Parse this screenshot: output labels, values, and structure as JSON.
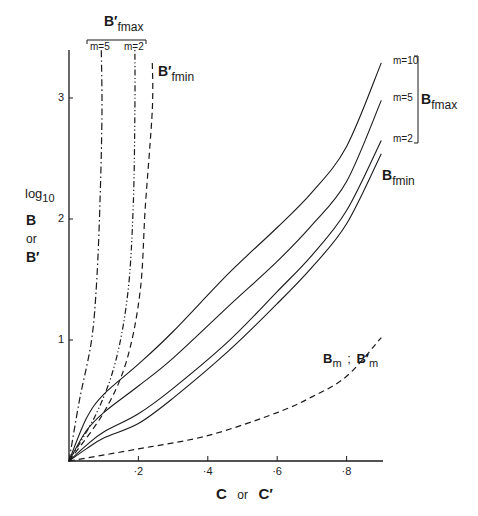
{
  "chart_data": {
    "type": "line",
    "title": "",
    "xlabel": "C or C′",
    "ylabel": "log10 B or B′",
    "xlim": [
      0,
      0.9
    ],
    "ylim": [
      0,
      3.4
    ],
    "grid": false,
    "x_ticks": [
      {
        "value": 0.2,
        "label": "·2"
      },
      {
        "value": 0.4,
        "label": "·4"
      },
      {
        "value": 0.6,
        "label": "·6"
      },
      {
        "value": 0.8,
        "label": "·8"
      }
    ],
    "y_ticks": [
      {
        "value": 1,
        "label": "1"
      },
      {
        "value": 2,
        "label": "2"
      },
      {
        "value": 3,
        "label": "3"
      }
    ],
    "series": [
      {
        "name": "B fmax m=10",
        "style": "solid",
        "x": [
          0,
          0.05,
          0.1,
          0.2,
          0.3,
          0.46,
          0.6,
          0.7,
          0.8,
          0.9
        ],
        "y": [
          0,
          0.35,
          0.55,
          0.8,
          1.07,
          1.55,
          1.93,
          2.22,
          2.6,
          3.29
        ]
      },
      {
        "name": "B fmax m=5",
        "style": "solid",
        "x": [
          0,
          0.05,
          0.1,
          0.2,
          0.3,
          0.46,
          0.6,
          0.7,
          0.8,
          0.9
        ],
        "y": [
          0,
          0.25,
          0.4,
          0.62,
          0.85,
          1.28,
          1.65,
          1.95,
          2.31,
          2.98
        ]
      },
      {
        "name": "B fmax m=2",
        "style": "solid",
        "x": [
          0,
          0.05,
          0.1,
          0.2,
          0.3,
          0.46,
          0.6,
          0.7,
          0.8,
          0.9
        ],
        "y": [
          0,
          0.13,
          0.24,
          0.39,
          0.6,
          0.99,
          1.4,
          1.7,
          2.07,
          2.65
        ]
      },
      {
        "name": "B fmin",
        "style": "solid",
        "x": [
          0,
          0.05,
          0.1,
          0.2,
          0.3,
          0.46,
          0.6,
          0.7,
          0.8,
          0.9
        ],
        "y": [
          0,
          0.1,
          0.19,
          0.31,
          0.52,
          0.91,
          1.3,
          1.6,
          1.96,
          2.54
        ]
      },
      {
        "name": "B′ fmax m=5",
        "style": "dash-dot",
        "x": [
          0,
          0.03,
          0.065,
          0.08,
          0.09,
          0.095,
          0.093
        ],
        "y": [
          0,
          0.5,
          1.0,
          1.5,
          2.2,
          2.9,
          3.4
        ]
      },
      {
        "name": "B′ fmax m=2",
        "style": "dash-dot-dot",
        "x": [
          0,
          0.08,
          0.135,
          0.17,
          0.185,
          0.19,
          0.19
        ],
        "y": [
          0,
          0.4,
          0.83,
          1.4,
          2.1,
          2.9,
          3.4
        ]
      },
      {
        "name": "B′ fmin",
        "style": "dashed",
        "x": [
          0,
          0.1,
          0.165,
          0.205,
          0.22,
          0.24,
          0.24
        ],
        "y": [
          0,
          0.4,
          0.82,
          1.4,
          2.1,
          2.9,
          3.3
        ]
      },
      {
        "name": "Bm ; B′m",
        "style": "dashed",
        "x": [
          0,
          0.2,
          0.4,
          0.6,
          0.7,
          0.8,
          0.9
        ],
        "y": [
          0,
          0.1,
          0.21,
          0.4,
          0.53,
          0.7,
          1.02
        ]
      }
    ],
    "annotations": [
      {
        "text": "m=10",
        "near": "B fmax m=10 end"
      },
      {
        "text": "m=5",
        "near": "B fmax m=5 end"
      },
      {
        "text": "m=2",
        "near": "B fmax m=2 end"
      },
      {
        "text": "B fmax",
        "note": "bracket grouping m=10, m=5, m=2"
      },
      {
        "text": "B fmin",
        "near": "lowest solid curve end"
      },
      {
        "text": "B′ fmax",
        "note": "top bracket grouping m=5, m=2"
      },
      {
        "text": "B′ fmin",
        "near": "rightmost steep dashed curve"
      },
      {
        "text": "Bm ; B′m",
        "near": "lower dashed curve"
      }
    ]
  },
  "labels": {
    "ylabel_log": "log",
    "ylabel_log_sub": "10",
    "ylabel_B": "B",
    "ylabel_or": "or",
    "ylabel_Bprime": "B′",
    "xlabel_C": "C",
    "xlabel_or": "or",
    "xlabel_Cprime": "C′",
    "bfmax_main": "B",
    "bfmax_sub": "fmax",
    "bfmin_main": "B",
    "bfmin_sub": "fmin",
    "bpfmax_main": "B′",
    "bpfmax_sub": "fmax",
    "bpfmin_main": "B′",
    "bpfmin_sub": "fmin",
    "bm_main": "B",
    "bm_sub": "m",
    "bm_sep": ";",
    "bpm_main": "B′",
    "bpm_sub": "m",
    "m10": "m=10",
    "m5": "m=5",
    "m2": "m=2",
    "pm5": "m=5",
    "pm2": "m=2"
  },
  "colors": {
    "ink": "#1a1a1a",
    "background": "#ffffff"
  }
}
